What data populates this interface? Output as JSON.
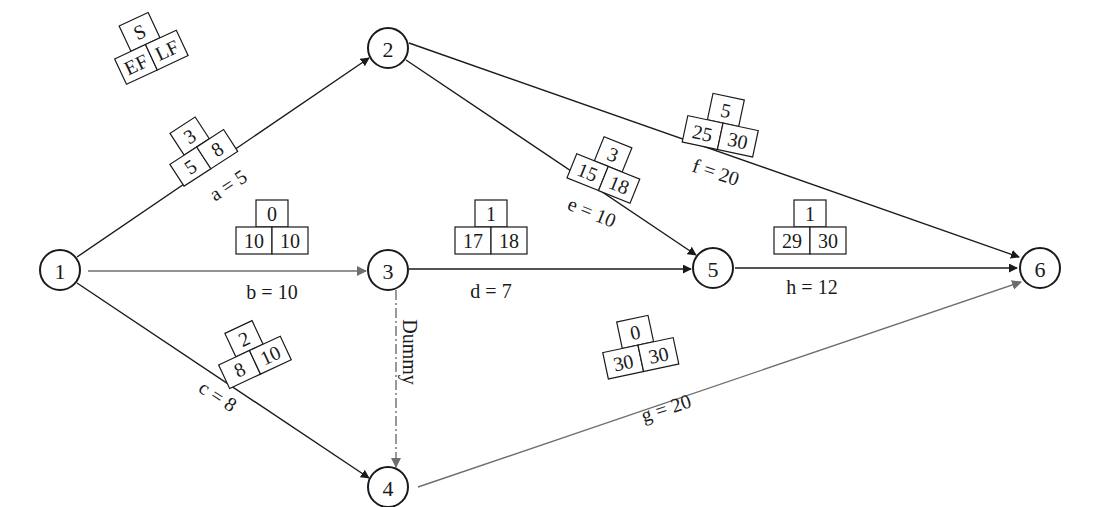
{
  "diagram": {
    "type": "activity-on-arrow network",
    "legend": {
      "top": "S",
      "bottom_left": "EF",
      "bottom_right": "LF"
    },
    "colors": {
      "line_dark": "#1a1a1a",
      "line_gray": "#6e6e6e"
    },
    "nodes": [
      {
        "id": "1",
        "label": "1",
        "x": 60,
        "y": 270
      },
      {
        "id": "2",
        "label": "2",
        "x": 388,
        "y": 48
      },
      {
        "id": "3",
        "label": "3",
        "x": 388,
        "y": 270
      },
      {
        "id": "4",
        "label": "4",
        "x": 388,
        "y": 490
      },
      {
        "id": "5",
        "label": "5",
        "x": 713,
        "y": 268
      },
      {
        "id": "6",
        "label": "6",
        "x": 1040,
        "y": 268
      }
    ],
    "activities": [
      {
        "name": "a",
        "from": "1",
        "to": "2",
        "label": "a = 5",
        "duration": 5,
        "slack": "3",
        "ef": "5",
        "lf": "8"
      },
      {
        "name": "b",
        "from": "1",
        "to": "3",
        "label": "b = 10",
        "duration": 10,
        "slack": "0",
        "ef": "10",
        "lf": "10"
      },
      {
        "name": "c",
        "from": "1",
        "to": "4",
        "label": "c = 8",
        "duration": 8,
        "slack": "2",
        "ef": "8",
        "lf": "10"
      },
      {
        "name": "d",
        "from": "3",
        "to": "5",
        "label": "d = 7",
        "duration": 7,
        "slack": "1",
        "ef": "17",
        "lf": "18"
      },
      {
        "name": "e",
        "from": "2",
        "to": "5",
        "label": "e = 10",
        "duration": 10,
        "slack": "3",
        "ef": "15",
        "lf": "18"
      },
      {
        "name": "f",
        "from": "2",
        "to": "6",
        "label": "f = 20",
        "duration": 20,
        "slack": "5",
        "ef": "25",
        "lf": "30"
      },
      {
        "name": "g",
        "from": "4",
        "to": "6",
        "label": "g = 20",
        "duration": 20,
        "slack": "0",
        "ef": "30",
        "lf": "30"
      },
      {
        "name": "h",
        "from": "5",
        "to": "6",
        "label": "h = 12",
        "duration": 12,
        "slack": "1",
        "ef": "29",
        "lf": "30"
      },
      {
        "name": "dummy",
        "from": "3",
        "to": "4",
        "label": "Dummy"
      }
    ]
  }
}
